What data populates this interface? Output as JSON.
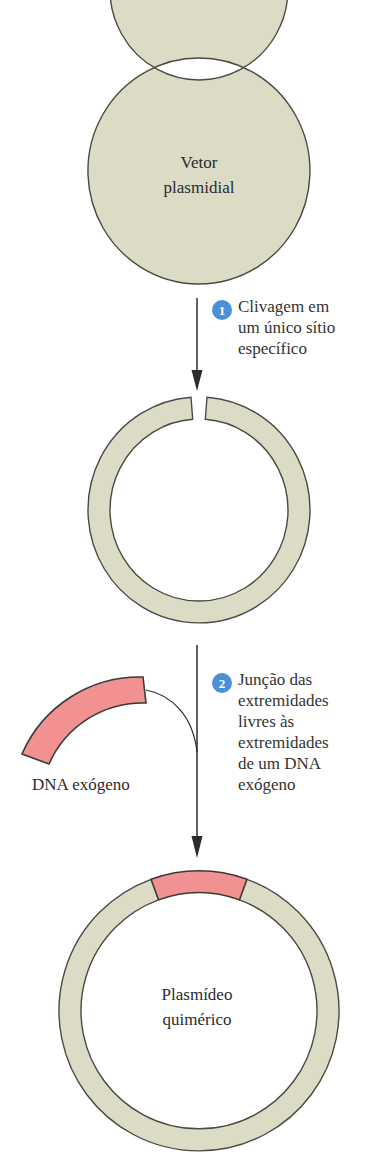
{
  "diagram": {
    "language": "pt-BR",
    "colors": {
      "plasmid_fill": "#dcdcc6",
      "plasmid_stroke": "#4a4a42",
      "insert_fill": "#f29191",
      "insert_stroke": "#3a3a36",
      "badge_blue": "#4a90d9",
      "text": "#333333",
      "arrow": "#2b2b2b",
      "background": "#ffffff"
    }
  },
  "stages": {
    "vector": {
      "label_line1": "Vetor",
      "label_line2": "plasmidial",
      "label": "Vetor plasmidial"
    },
    "cut_vector": {
      "label": ""
    },
    "fragment": {
      "label": "DNA exógeno"
    },
    "chimeric": {
      "label_line1": "Plasmídeo",
      "label_line2": "quimérico",
      "label": "Plasmídeo quimérico"
    }
  },
  "steps": [
    {
      "number": "1",
      "text": "Clivagem em\num único sítio\nespecífico"
    },
    {
      "number": "2",
      "text": "Junção das\nextremidades\nlivres às\nextremidades\nde um DNA\nexógeno"
    }
  ]
}
